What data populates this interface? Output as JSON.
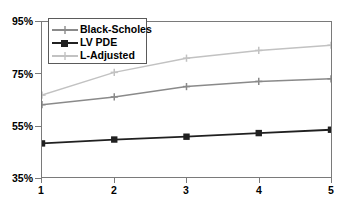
{
  "chart_data": {
    "type": "line",
    "title": "",
    "subtitle": "",
    "xlabel": "",
    "ylabel": "",
    "x": [
      1,
      2,
      3,
      4,
      5
    ],
    "xticklabels": [
      "1",
      "2",
      "3",
      "4",
      "5"
    ],
    "yticklabels": [
      "95%",
      "75%",
      "55%",
      "35%"
    ],
    "ytickvalues": [
      95,
      75,
      55,
      35
    ],
    "xlim": [
      1,
      5
    ],
    "ylim": [
      35,
      95
    ],
    "grid": false,
    "legend_position": "upper-left-inside",
    "series": [
      {
        "name": "Black-Scholes",
        "color": "#8a8a8a",
        "marker": "plus",
        "values": [
          63,
          66,
          70,
          72,
          73
        ]
      },
      {
        "name": "LV PDE",
        "color": "#202020",
        "marker": "square",
        "values": [
          48,
          49.5,
          50.6,
          52,
          53.3
        ]
      },
      {
        "name": "L-Adjusted",
        "color": "#c2c2c2",
        "marker": "plus",
        "values": [
          66.7,
          75.5,
          81,
          84,
          86
        ]
      }
    ]
  },
  "axes": {
    "y_labels": [
      "95%",
      "75%",
      "55%",
      "35%"
    ],
    "x_labels": [
      "1",
      "2",
      "3",
      "4",
      "5"
    ]
  },
  "legend": {
    "entries": [
      {
        "label": "Black-Scholes"
      },
      {
        "label": "LV PDE"
      },
      {
        "label": "L-Adjusted"
      }
    ]
  },
  "colors": {
    "axis": "#7a7a7a",
    "text": "#000000",
    "background": "#ffffff",
    "black_scholes": "#8a8a8a",
    "lv_pde": "#202020",
    "l_adjusted": "#c2c2c2"
  }
}
